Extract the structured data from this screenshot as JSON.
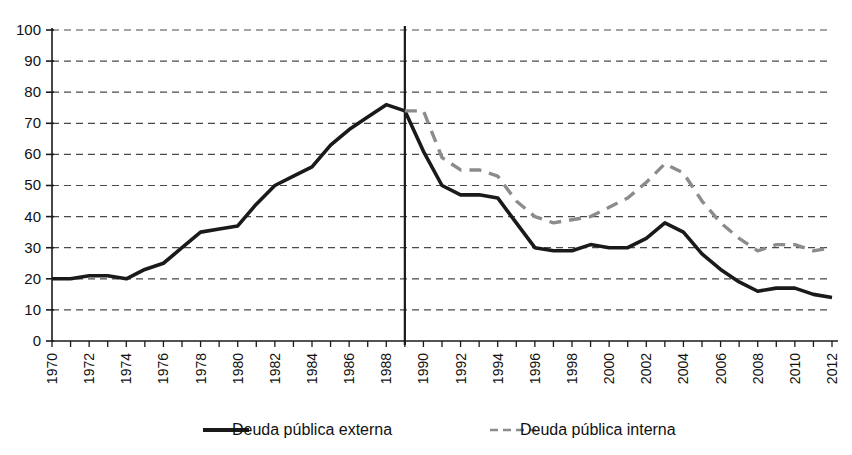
{
  "chart_data": {
    "type": "line",
    "title": "",
    "subtitle": "",
    "xlabel": "",
    "ylabel": "",
    "xlim": [
      1970,
      2012
    ],
    "ylim": [
      0,
      100
    ],
    "y_ticks": [
      0,
      10,
      20,
      30,
      40,
      50,
      60,
      70,
      80,
      90,
      100
    ],
    "x_ticks": [
      1970,
      1972,
      1974,
      1976,
      1978,
      1980,
      1982,
      1984,
      1986,
      1988,
      1990,
      1992,
      1994,
      1996,
      1998,
      2000,
      2002,
      2004,
      2006,
      2008,
      2010,
      2012
    ],
    "x_tick_labels": [
      "1970",
      "1972",
      "1974",
      "1976",
      "1978",
      "1980",
      "1982",
      "1984",
      "1986",
      "1988",
      "1990",
      "1992",
      "1994",
      "1996",
      "1998",
      "2000",
      "2002",
      "2004",
      "2006",
      "2008",
      "2010",
      "2012"
    ],
    "y_tick_labels": [
      "0",
      "10",
      "20",
      "30",
      "40",
      "50",
      "60",
      "70",
      "80",
      "90",
      "100"
    ],
    "grid": "horizontal-dashed",
    "legend_position": "bottom",
    "annotations": [
      {
        "name": "vertical-reference-line",
        "x": 1989,
        "style": "solid-black-vertical"
      }
    ],
    "series": [
      {
        "name": "Deuda pública externa",
        "style": "solid",
        "color": "#1a1a1a",
        "x": [
          1970,
          1971,
          1972,
          1973,
          1974,
          1975,
          1976,
          1977,
          1978,
          1979,
          1980,
          1981,
          1982,
          1983,
          1984,
          1985,
          1986,
          1987,
          1988,
          1989,
          1990,
          1991,
          1992,
          1993,
          1994,
          1995,
          1996,
          1997,
          1998,
          1999,
          2000,
          2001,
          2002,
          2003,
          2004,
          2005,
          2006,
          2007,
          2008,
          2009,
          2010,
          2011,
          2012
        ],
        "values": [
          20,
          20,
          21,
          21,
          20,
          23,
          25,
          30,
          35,
          36,
          37,
          44,
          50,
          53,
          56,
          63,
          68,
          72,
          76,
          74,
          61,
          50,
          47,
          47,
          46,
          38,
          30,
          29,
          29,
          31,
          30,
          30,
          33,
          38,
          35,
          28,
          23,
          19,
          16,
          17,
          17,
          15,
          14
        ]
      },
      {
        "name": "Deuda pública interna",
        "style": "dashed",
        "color": "#8c8c8c",
        "x": [
          1989,
          1990,
          1991,
          1992,
          1993,
          1994,
          1995,
          1996,
          1997,
          1998,
          1999,
          2000,
          2001,
          2002,
          2003,
          2004,
          2005,
          2006,
          2007,
          2008,
          2009,
          2010,
          2011,
          2012
        ],
        "values": [
          74,
          74,
          59,
          55,
          55,
          53,
          45,
          40,
          38,
          39,
          40,
          43,
          46,
          51,
          57,
          54,
          45,
          38,
          33,
          29,
          31,
          31,
          29,
          30
        ]
      }
    ]
  },
  "legend": {
    "items": [
      {
        "label": "Deuda pública externa",
        "style": "solid",
        "color": "#1a1a1a"
      },
      {
        "label": "Deuda pública interna",
        "style": "dashed",
        "color": "#8c8c8c"
      }
    ]
  }
}
